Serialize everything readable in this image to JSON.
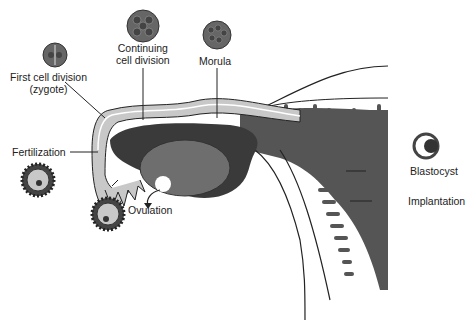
{
  "labels": {
    "first_cell_division_line1": "First cell division",
    "first_cell_division_line2": "(zygote)",
    "continuing_line1": "Continuing",
    "continuing_line2": "cell division",
    "morula": "Morula",
    "fertilization": "Fertilization",
    "ovulation": "Ovulation",
    "blastocyst": "Blastocyst",
    "implantation": "Implantation"
  },
  "colors": {
    "tube_light": "#c8c8c8",
    "tissue_dark": "#555555",
    "ovary": "#6e6e6e",
    "outline": "#222222"
  }
}
